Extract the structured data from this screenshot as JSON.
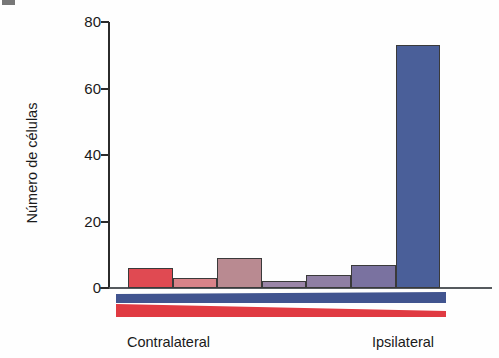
{
  "figure": {
    "panel_marker": "",
    "background_color": "#fefefe"
  },
  "chart_data": {
    "type": "bar",
    "title": "",
    "xlabel": "",
    "ylabel": "Número de células",
    "ylim": [
      0,
      80
    ],
    "yticks": [
      0,
      20,
      40,
      60,
      80
    ],
    "ytick_labels": [
      "0",
      "20",
      "40",
      "60",
      "80"
    ],
    "grid": false,
    "legend": null,
    "categories": [
      "1",
      "2",
      "3",
      "4",
      "5",
      "6",
      "7"
    ],
    "values": [
      6,
      3,
      9,
      2,
      4,
      7,
      73
    ],
    "bar_colors": [
      "#e04a52",
      "#d88389",
      "#b98a91",
      "#9b86a8",
      "#8f7fa4",
      "#7a72a0",
      "#4a5f99"
    ],
    "bar_edge_color": "#3a3a3a",
    "axis_color": "#2b2b2b",
    "annotations": [
      {
        "name": "contralateral",
        "text": "Contralateral",
        "position": "bottom-left"
      },
      {
        "name": "ipsilateral",
        "text": "Ipsilateral",
        "position": "bottom-right"
      }
    ]
  },
  "gradient_bands": {
    "contralateral_color": "#e03a42",
    "ipsilateral_color": "#41548f",
    "description": "two opposing triangular wedges beneath the x-axis"
  },
  "labels": {
    "contralateral": "Contralateral",
    "ipsilateral": "Ipsilateral"
  }
}
